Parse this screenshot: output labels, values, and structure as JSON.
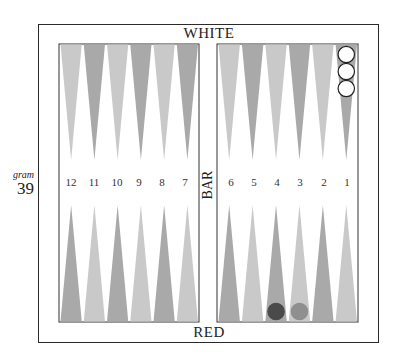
{
  "caption": {
    "word": "gram",
    "number": "39"
  },
  "board": {
    "top_label": "WHITE",
    "bottom_label": "RED",
    "bar_label": "BAR",
    "colors": {
      "light_point": "#c9c9c9",
      "dark_point": "#a9a9a9",
      "white_checker": "#ffffff",
      "red_checker_dark": "#4a4a4a",
      "red_checker_light": "#8f8f8f",
      "frame": "#2a2a2a"
    },
    "point_numbers": {
      "left": [
        "12",
        "11",
        "10",
        "9",
        "8",
        "7"
      ],
      "right": [
        "6",
        "5",
        "4",
        "3",
        "2",
        "1"
      ]
    },
    "top_points": {
      "left": [
        "light",
        "dark",
        "light",
        "dark",
        "light",
        "dark"
      ],
      "right": [
        "light",
        "dark",
        "light",
        "dark",
        "light",
        "dark"
      ]
    },
    "bottom_points": {
      "left": [
        "dark",
        "light",
        "dark",
        "light",
        "dark",
        "light"
      ],
      "right": [
        "dark",
        "light",
        "dark",
        "light",
        "dark",
        "light"
      ]
    },
    "checkers": [
      {
        "side": "white",
        "point": 1,
        "row": "top",
        "count": 3,
        "color": "white"
      },
      {
        "side": "red",
        "point": 4,
        "row": "bottom",
        "count": 1,
        "color": "dark"
      },
      {
        "side": "red",
        "point": 3,
        "row": "bottom",
        "count": 1,
        "color": "grey"
      }
    ]
  }
}
